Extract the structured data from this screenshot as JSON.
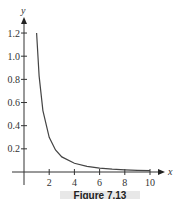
{
  "chart_data": {
    "type": "line",
    "title": "",
    "xlabel": "x",
    "ylabel": "y",
    "xlim": [
      0,
      10.5
    ],
    "ylim": [
      0,
      1.3
    ],
    "x_ticks": [
      2,
      4,
      6,
      8,
      10
    ],
    "y_ticks": [
      0.2,
      0.4,
      0.6,
      0.8,
      1.0,
      1.2
    ],
    "x_tick_labels": [
      "2",
      "4",
      "6",
      "8",
      "10"
    ],
    "y_tick_labels": [
      "0.2",
      "0.4",
      "0.6",
      "0.8",
      "1.0",
      "1.2"
    ],
    "grid": false,
    "series": [
      {
        "name": "curve",
        "x": [
          1,
          1.2,
          1.5,
          2,
          2.5,
          3,
          4,
          5,
          6,
          7,
          8,
          9,
          10
        ],
        "y": [
          1.2,
          0.83,
          0.53,
          0.3,
          0.19,
          0.13,
          0.075,
          0.048,
          0.033,
          0.024,
          0.019,
          0.015,
          0.012
        ]
      }
    ]
  },
  "caption": "Figure 7.13"
}
